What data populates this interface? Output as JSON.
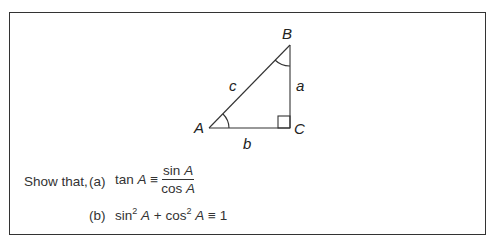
{
  "diagram": {
    "vertices": {
      "A": "A",
      "B": "B",
      "C": "C"
    },
    "sides": {
      "a": "a",
      "b": "b",
      "c": "c"
    },
    "right_angle_at": "C",
    "marked_angles": [
      "A",
      "B"
    ]
  },
  "question": {
    "prompt": "Show that,",
    "parts": [
      {
        "label": "(a)",
        "lhs_fn": "tan",
        "lhs_var": "A",
        "op": "≡",
        "num_fn": "sin",
        "num_var": "A",
        "den_fn": "cos",
        "den_var": "A"
      },
      {
        "label": "(b)",
        "t1_fn": "sin",
        "t1_exp": "2",
        "t1_var": "A",
        "plus": "+",
        "t2_fn": "cos",
        "t2_exp": "2",
        "t2_var": "A",
        "op": "≡",
        "rhs": "1"
      }
    ]
  }
}
